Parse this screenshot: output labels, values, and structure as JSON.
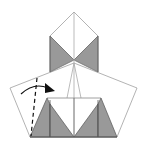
{
  "diagram": {
    "type": "origami-fold-step",
    "colors": {
      "paper": "#ffffff",
      "shade": "#999999",
      "outline": "#aaaaaa",
      "dark_edge": "#555555",
      "arrow": "#111111"
    },
    "instruction_marks": {
      "valley_fold_line": "dashed",
      "fold_arrow": "curved-arrow-right"
    }
  }
}
